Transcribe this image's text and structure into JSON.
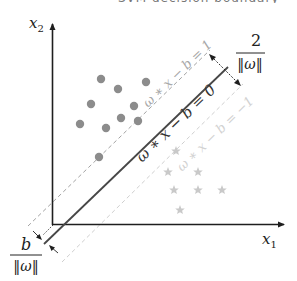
{
  "top_cut_text": "SVM decision boundary",
  "axes": {
    "x_label": "x",
    "x_sub": "1",
    "y_label": "x",
    "y_sub": "2"
  },
  "lines": {
    "hyperplane_label": "ω ∗ x − b = 0",
    "upper_margin_label": "ω ∗ x − b = 1",
    "lower_margin_label": "ω ∗ x − b = −1"
  },
  "margin_width": {
    "numerator": "2",
    "denominator": "‖ω‖"
  },
  "offset": {
    "numerator": "b",
    "denominator": "‖ω‖"
  },
  "classes": {
    "positive": {
      "marker": "circle",
      "color": "#8c8c8c",
      "points": [
        [
          101,
          79
        ],
        [
          118,
          89
        ],
        [
          146,
          82
        ],
        [
          91,
          104
        ],
        [
          134,
          106
        ],
        [
          121,
          118
        ],
        [
          138,
          121
        ],
        [
          80,
          124
        ],
        [
          106,
          128
        ],
        [
          99,
          157
        ]
      ]
    },
    "negative": {
      "marker": "star",
      "color": "#c9c9c9",
      "points": [
        [
          176,
          151
        ],
        [
          168,
          172
        ],
        [
          198,
          172
        ],
        [
          174,
          190
        ],
        [
          198,
          190
        ],
        [
          222,
          190
        ],
        [
          180,
          210
        ]
      ]
    }
  },
  "colors": {
    "axis": "#1e1e1e",
    "hyperplane": "#474747",
    "upper_margin": "#a3a3a3",
    "lower_margin": "#cfcfcf",
    "upper_label": "#a8a8a8",
    "lower_label": "#d2d2d2"
  }
}
